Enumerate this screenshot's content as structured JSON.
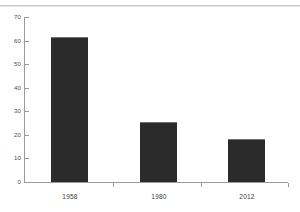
{
  "chart_data": {
    "type": "bar",
    "title": "",
    "xlabel": "",
    "ylabel": "",
    "categories": [
      "1958",
      "1980",
      "2012"
    ],
    "values": [
      61,
      25,
      18
    ],
    "ylim": [
      0,
      70
    ],
    "yticks": [
      0,
      10,
      20,
      30,
      40,
      50,
      60,
      70
    ],
    "ytick_labels": [
      "0",
      "10",
      "20",
      "30",
      "40",
      "50",
      "60",
      "70"
    ],
    "grid": false,
    "legend": null,
    "series": [
      {
        "name": "",
        "values": [
          61,
          25,
          18
        ]
      }
    ],
    "bar_color": "#2b2b2b",
    "axis_color": "#9a9a9a",
    "background_color": "#ffffff"
  },
  "axis": {
    "y_labels": [
      "70",
      "60",
      "50",
      "40",
      "30",
      "20",
      "10",
      "0"
    ],
    "x_labels": [
      "1958",
      "1980",
      "2012"
    ]
  }
}
